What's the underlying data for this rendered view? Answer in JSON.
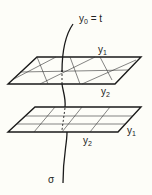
{
  "figure": {
    "type": "diagram",
    "curve_top_label": {
      "base": "y",
      "sub": "0",
      "rest": " = t"
    },
    "curve_bottom_label": "σ",
    "top_plane": {
      "label_y1": {
        "base": "y",
        "sub": "1"
      },
      "label_y2": {
        "base": "y",
        "sub": "2"
      },
      "grid": "skewed"
    },
    "bottom_plane": {
      "label_y1": {
        "base": "y",
        "sub": "1"
      },
      "label_y2": {
        "base": "y",
        "sub": "2"
      },
      "grid": "rectangular"
    },
    "colors": {
      "line": "#1a1a1a",
      "background": "#fdfdf8"
    }
  }
}
